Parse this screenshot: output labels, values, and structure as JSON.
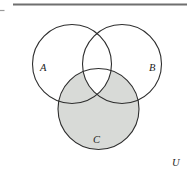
{
  "diagram": {
    "type": "venn-diagram",
    "labels": {
      "set_a": "A",
      "set_b": "B",
      "set_c": "C",
      "universe": "U"
    },
    "shaded_region": "C − (A ∩ B)",
    "colors": {
      "shade": "#d8dad7",
      "unshaded": "#ffffff",
      "circle_stroke": "#2e2e2e",
      "border_top": "#6f6f6f",
      "border_left": "#8a8a8a",
      "border_right": "#c6c6c6",
      "label_color": "#1c1c1c",
      "tick_color": "#9a9a9a"
    }
  }
}
